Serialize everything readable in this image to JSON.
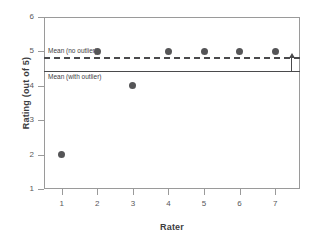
{
  "chart_data": {
    "type": "scatter",
    "title": "",
    "xlabel": "Rater",
    "ylabel": "Rating (out of 5)",
    "x": [
      1,
      2,
      3,
      4,
      5,
      6,
      7
    ],
    "values": [
      2,
      5,
      4,
      5,
      5,
      5,
      5
    ],
    "categories": [
      "1",
      "2",
      "3",
      "4",
      "5",
      "6",
      "7"
    ],
    "series": [
      {
        "name": "Rating",
        "values": [
          2,
          5,
          4,
          5,
          5,
          5,
          5
        ]
      }
    ],
    "xlim": [
      0.5,
      7.7
    ],
    "ylim": [
      1,
      6
    ],
    "xticks": [
      "1",
      "2",
      "3",
      "4",
      "5",
      "6",
      "7"
    ],
    "yticks": [
      "1",
      "2",
      "3",
      "4",
      "5",
      "6"
    ],
    "grid": false,
    "legend": "none",
    "marker_color": "#555557",
    "line_color": "#4a4a4c",
    "axis_color": "#9a9a9a",
    "annotations": [
      {
        "id": "mean-no-outlier",
        "label": "Mean (no outlier)",
        "value": 4.83,
        "style": "dashed"
      },
      {
        "id": "mean-with-outlier",
        "label": "Mean (with outlier)",
        "value": 4.43,
        "style": "solid"
      },
      {
        "id": "gap-arrow",
        "label": "",
        "from": 4.43,
        "to": 4.83,
        "style": "arrow-up"
      }
    ]
  },
  "axes": {
    "y_title": "Rating (out of 5)",
    "x_title": "Rater",
    "y_ticks": [
      {
        "label": "6",
        "value": 6
      },
      {
        "label": "5",
        "value": 5
      },
      {
        "label": "4",
        "value": 4
      },
      {
        "label": "3",
        "value": 3
      },
      {
        "label": "2",
        "value": 2
      },
      {
        "label": "1",
        "value": 1
      }
    ],
    "x_ticks": [
      {
        "label": "1",
        "value": 1
      },
      {
        "label": "2",
        "value": 2
      },
      {
        "label": "3",
        "value": 3
      },
      {
        "label": "4",
        "value": 4
      },
      {
        "label": "5",
        "value": 5
      },
      {
        "label": "6",
        "value": 6
      },
      {
        "label": "7",
        "value": 7
      }
    ]
  },
  "reference_lines": {
    "no_outlier_label": "Mean (no outlier)",
    "with_outlier_label": "Mean (with outlier)"
  }
}
